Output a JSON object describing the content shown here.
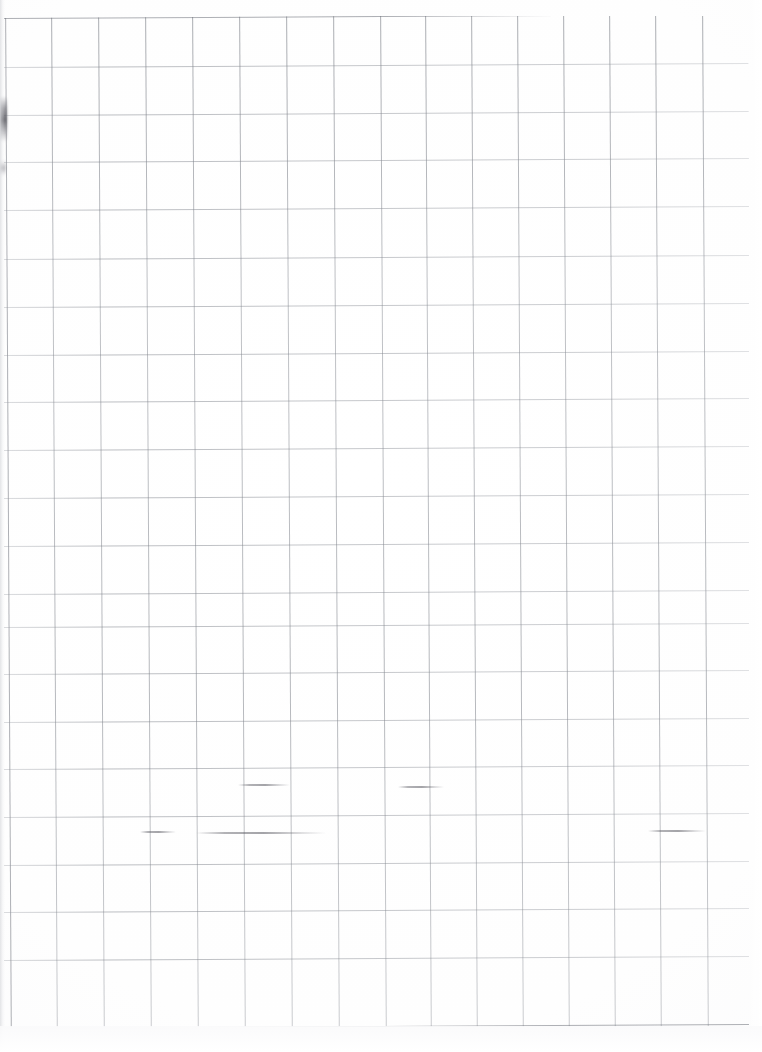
{
  "document": {
    "type": "scanned-graph-paper",
    "title": "Blank quadrille graph paper scan",
    "visible_text": "",
    "page_width_px": 762,
    "page_height_px": 1052,
    "paper_color": "#ffffff",
    "grid_line_color": "#7f838b",
    "background_color": "#ffffff"
  },
  "grid": {
    "description": "Ruled square grid, slightly rotated from scanning",
    "rotation_deg": -0.32,
    "column_count": 16,
    "row_count": 21,
    "cell_width_px": 47,
    "cell_height_px": 48,
    "origin_x_px": 4,
    "origin_y_px": 16,
    "right_edge_x_px": 748,
    "bottom_edge_y_px": 1026,
    "vertical_line_x": [
      4,
      50,
      97,
      144,
      191,
      238,
      285,
      332,
      379,
      424,
      470,
      516,
      562,
      608,
      654,
      701,
      748
    ],
    "horizontal_line_y": [
      16,
      65,
      113,
      160,
      208,
      257,
      305,
      353,
      400,
      448,
      496,
      544,
      592,
      625,
      672,
      720,
      767,
      815,
      863,
      910,
      958,
      1026
    ]
  },
  "marks": [
    {
      "name": "left-edge-smudge",
      "kind": "dark-scan-smudge",
      "x": 0,
      "y": 96,
      "width": 7,
      "height": 46
    },
    {
      "name": "left-edge-smudge-lower",
      "kind": "faint-scan-smudge",
      "x": 0,
      "y": 160,
      "width": 6,
      "height": 16
    },
    {
      "name": "pencil-stroke-upper-left",
      "kind": "pencil-stroke",
      "x": 238,
      "y": 784,
      "width": 52,
      "height": 2
    },
    {
      "name": "pencil-stroke-upper-right",
      "kind": "pencil-stroke",
      "x": 398,
      "y": 786,
      "width": 46,
      "height": 2
    },
    {
      "name": "pencil-stroke-lower-left",
      "kind": "pencil-stroke",
      "x": 140,
      "y": 831,
      "width": 36,
      "height": 2
    },
    {
      "name": "pencil-stroke-lower-mid",
      "kind": "pencil-stroke",
      "x": 196,
      "y": 832,
      "width": 130,
      "height": 2
    },
    {
      "name": "pencil-stroke-lower-right",
      "kind": "pencil-stroke",
      "x": 648,
      "y": 830,
      "width": 58,
      "height": 2
    }
  ]
}
